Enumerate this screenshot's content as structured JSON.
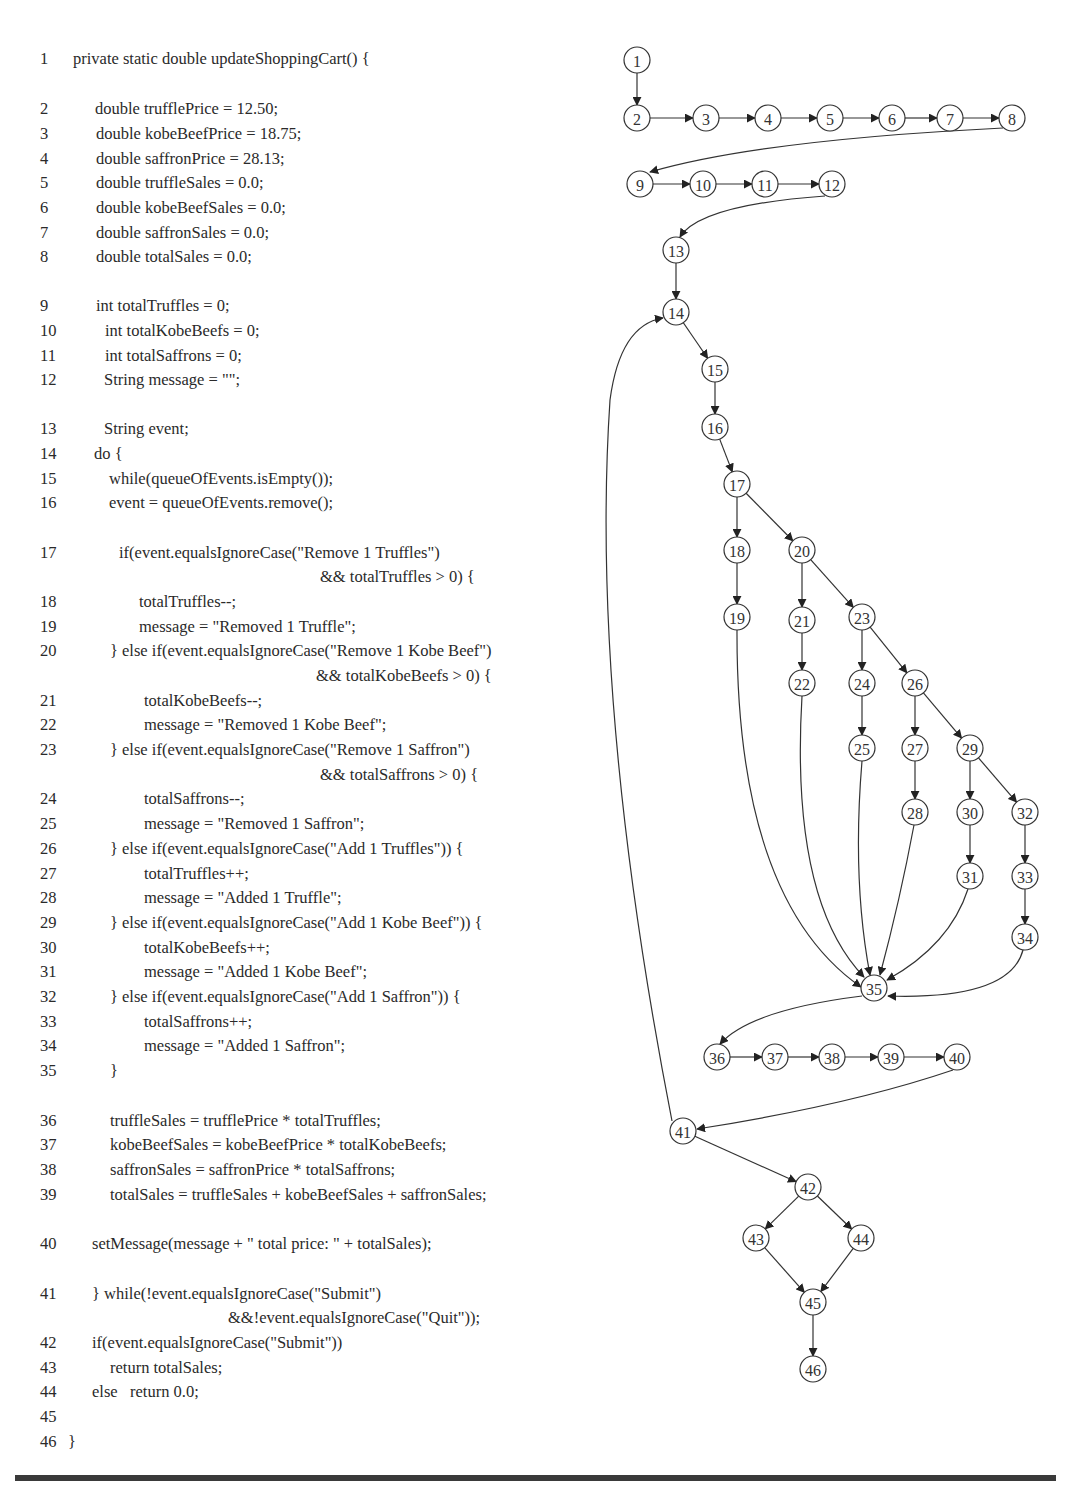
{
  "code": {
    "lines": [
      {
        "n": "1",
        "y": 60,
        "x": 73,
        "text": "private static double updateShoppingCart() {"
      },
      {
        "n": "2",
        "y": 110,
        "x": 95,
        "text": "double trufflePrice = 12.50;"
      },
      {
        "n": "3",
        "y": 135,
        "x": 96,
        "text": "double kobeBeefPrice = 18.75;"
      },
      {
        "n": "4",
        "y": 160,
        "x": 96,
        "text": "double saffronPrice = 28.13;"
      },
      {
        "n": "5",
        "y": 184,
        "x": 96,
        "text": "double truffleSales = 0.0;"
      },
      {
        "n": "6",
        "y": 209,
        "x": 96,
        "text": "double kobeBeefSales = 0.0;"
      },
      {
        "n": "7",
        "y": 234,
        "x": 96,
        "text": "double saffronSales = 0.0;"
      },
      {
        "n": "8",
        "y": 258,
        "x": 96,
        "text": "double totalSales = 0.0;"
      },
      {
        "n": "9",
        "y": 307,
        "x": 96,
        "text": "int totalTruffles = 0;"
      },
      {
        "n": "10",
        "y": 332,
        "x": 105,
        "text": "int totalKobeBeefs = 0;"
      },
      {
        "n": "11",
        "y": 357,
        "x": 105,
        "text": "int totalSaffrons = 0;"
      },
      {
        "n": "12",
        "y": 381,
        "x": 104,
        "text": "String message = \"\";"
      },
      {
        "n": "13",
        "y": 430,
        "x": 104,
        "text": "String event;"
      },
      {
        "n": "14",
        "y": 455,
        "x": 94,
        "text": "do {"
      },
      {
        "n": "15",
        "y": 480,
        "x": 109,
        "text": "while(queueOfEvents.isEmpty());"
      },
      {
        "n": "16",
        "y": 504,
        "x": 109,
        "text": "event = queueOfEvents.remove();"
      },
      {
        "n": "17",
        "y": 554,
        "x": 119,
        "text": "if(event.equalsIgnoreCase(\"Remove 1 Truffles\")"
      },
      {
        "n": "",
        "y": 578,
        "x": 320,
        "text": "&& totalTruffles > 0) {"
      },
      {
        "n": "18",
        "y": 603,
        "x": 139,
        "text": "totalTruffles--;"
      },
      {
        "n": "19",
        "y": 628,
        "x": 139,
        "text": "message = \"Removed 1 Truffle\";"
      },
      {
        "n": "20",
        "y": 652,
        "x": 110,
        "text": "} else if(event.equalsIgnoreCase(\"Remove 1 Kobe Beef\")"
      },
      {
        "n": "",
        "y": 677,
        "x": 316,
        "text": "&& totalKobeBeefs > 0) {"
      },
      {
        "n": "21",
        "y": 702,
        "x": 144,
        "text": "totalKobeBeefs--;"
      },
      {
        "n": "22",
        "y": 726,
        "x": 144,
        "text": "message = \"Removed 1 Kobe Beef\";"
      },
      {
        "n": "23",
        "y": 751,
        "x": 110,
        "text": "} else if(event.equalsIgnoreCase(\"Remove 1 Saffron\")"
      },
      {
        "n": "",
        "y": 776,
        "x": 320,
        "text": "&& totalSaffrons > 0) {"
      },
      {
        "n": "24",
        "y": 800,
        "x": 144,
        "text": "totalSaffrons--;"
      },
      {
        "n": "25",
        "y": 825,
        "x": 144,
        "text": "message = \"Removed 1 Saffron\";"
      },
      {
        "n": "26",
        "y": 850,
        "x": 110,
        "text": "} else if(event.equalsIgnoreCase(\"Add 1 Truffles\")) {"
      },
      {
        "n": "27",
        "y": 875,
        "x": 144,
        "text": "totalTruffles++;"
      },
      {
        "n": "28",
        "y": 899,
        "x": 144,
        "text": "message = \"Added 1 Truffle\";"
      },
      {
        "n": "29",
        "y": 924,
        "x": 110,
        "text": "} else if(event.equalsIgnoreCase(\"Add 1 Kobe Beef\")) {"
      },
      {
        "n": "30",
        "y": 949,
        "x": 144,
        "text": "totalKobeBeefs++;"
      },
      {
        "n": "31",
        "y": 973,
        "x": 144,
        "text": "message = \"Added 1 Kobe Beef\";"
      },
      {
        "n": "32",
        "y": 998,
        "x": 110,
        "text": "} else if(event.equalsIgnoreCase(\"Add 1 Saffron\")) {"
      },
      {
        "n": "33",
        "y": 1023,
        "x": 144,
        "text": "totalSaffrons++;"
      },
      {
        "n": "34",
        "y": 1047,
        "x": 144,
        "text": "message = \"Added 1 Saffron\";"
      },
      {
        "n": "35",
        "y": 1072,
        "x": 110,
        "text": "}"
      },
      {
        "n": "36",
        "y": 1122,
        "x": 110,
        "text": "truffleSales = trufflePrice * totalTruffles;"
      },
      {
        "n": "37",
        "y": 1146,
        "x": 110,
        "text": "kobeBeefSales = kobeBeefPrice * totalKobeBeefs;"
      },
      {
        "n": "38",
        "y": 1171,
        "x": 110,
        "text": "saffronSales = saffronPrice * totalSaffrons;"
      },
      {
        "n": "39",
        "y": 1196,
        "x": 110,
        "text": "totalSales = truffleSales + kobeBeefSales + saffronSales;"
      },
      {
        "n": "40",
        "y": 1245,
        "x": 92,
        "text": "setMessage(message + \" total price: \" + totalSales);"
      },
      {
        "n": "41",
        "y": 1295,
        "x": 92,
        "text": "} while(!event.equalsIgnoreCase(\"Submit\")"
      },
      {
        "n": "",
        "y": 1319,
        "x": 228,
        "text": "&&!event.equalsIgnoreCase(\"Quit\"));"
      },
      {
        "n": "42",
        "y": 1344,
        "x": 92,
        "text": "if(event.equalsIgnoreCase(\"Submit\"))"
      },
      {
        "n": "43",
        "y": 1369,
        "x": 110,
        "text": "return totalSales;"
      },
      {
        "n": "44",
        "y": 1393,
        "x": 92,
        "text": "else   return 0.0;"
      },
      {
        "n": "45",
        "y": 1418,
        "x": 92,
        "text": ""
      },
      {
        "n": "46",
        "y": 1443,
        "x": 68,
        "text": "}"
      }
    ]
  },
  "graph": {
    "nodes": [
      {
        "id": "1",
        "x": 637,
        "y": 60
      },
      {
        "id": "2",
        "x": 637,
        "y": 118
      },
      {
        "id": "3",
        "x": 706,
        "y": 118
      },
      {
        "id": "4",
        "x": 768,
        "y": 118
      },
      {
        "id": "5",
        "x": 830,
        "y": 118
      },
      {
        "id": "6",
        "x": 892,
        "y": 118
      },
      {
        "id": "7",
        "x": 950,
        "y": 118
      },
      {
        "id": "8",
        "x": 1012,
        "y": 118
      },
      {
        "id": "9",
        "x": 640,
        "y": 184
      },
      {
        "id": "10",
        "x": 703,
        "y": 184
      },
      {
        "id": "11",
        "x": 765,
        "y": 184
      },
      {
        "id": "12",
        "x": 832,
        "y": 184
      },
      {
        "id": "13",
        "x": 676,
        "y": 250
      },
      {
        "id": "14",
        "x": 676,
        "y": 312
      },
      {
        "id": "15",
        "x": 715,
        "y": 369
      },
      {
        "id": "16",
        "x": 715,
        "y": 427
      },
      {
        "id": "17",
        "x": 737,
        "y": 484
      },
      {
        "id": "18",
        "x": 737,
        "y": 550
      },
      {
        "id": "20",
        "x": 802,
        "y": 550
      },
      {
        "id": "19",
        "x": 737,
        "y": 617
      },
      {
        "id": "21",
        "x": 802,
        "y": 620
      },
      {
        "id": "23",
        "x": 862,
        "y": 617
      },
      {
        "id": "22",
        "x": 802,
        "y": 683
      },
      {
        "id": "24",
        "x": 862,
        "y": 683
      },
      {
        "id": "26",
        "x": 915,
        "y": 683
      },
      {
        "id": "25",
        "x": 862,
        "y": 748
      },
      {
        "id": "27",
        "x": 915,
        "y": 748
      },
      {
        "id": "29",
        "x": 970,
        "y": 748
      },
      {
        "id": "28",
        "x": 915,
        "y": 812
      },
      {
        "id": "30",
        "x": 970,
        "y": 812
      },
      {
        "id": "32",
        "x": 1025,
        "y": 812
      },
      {
        "id": "31",
        "x": 970,
        "y": 876
      },
      {
        "id": "33",
        "x": 1025,
        "y": 876
      },
      {
        "id": "34",
        "x": 1025,
        "y": 937
      },
      {
        "id": "35",
        "x": 874,
        "y": 988
      },
      {
        "id": "36",
        "x": 717,
        "y": 1057
      },
      {
        "id": "37",
        "x": 775,
        "y": 1057
      },
      {
        "id": "38",
        "x": 832,
        "y": 1057
      },
      {
        "id": "39",
        "x": 891,
        "y": 1057
      },
      {
        "id": "40",
        "x": 957,
        "y": 1057
      },
      {
        "id": "41",
        "x": 683,
        "y": 1131
      },
      {
        "id": "42",
        "x": 808,
        "y": 1187
      },
      {
        "id": "43",
        "x": 756,
        "y": 1238
      },
      {
        "id": "44",
        "x": 861,
        "y": 1238
      },
      {
        "id": "45",
        "x": 813,
        "y": 1302
      },
      {
        "id": "46",
        "x": 813,
        "y": 1369
      }
    ],
    "edges": [
      [
        "1",
        "2"
      ],
      [
        "2",
        "3"
      ],
      [
        "3",
        "4"
      ],
      [
        "4",
        "5"
      ],
      [
        "5",
        "6"
      ],
      [
        "6",
        "7"
      ],
      [
        "7",
        "8"
      ],
      [
        "8",
        "9"
      ],
      [
        "9",
        "10"
      ],
      [
        "10",
        "11"
      ],
      [
        "11",
        "12"
      ],
      [
        "12",
        "13"
      ],
      [
        "13",
        "14"
      ],
      [
        "14",
        "15"
      ],
      [
        "15",
        "16"
      ],
      [
        "16",
        "17"
      ],
      [
        "17",
        "18"
      ],
      [
        "17",
        "20"
      ],
      [
        "18",
        "19"
      ],
      [
        "20",
        "21"
      ],
      [
        "20",
        "23"
      ],
      [
        "21",
        "22"
      ],
      [
        "23",
        "24"
      ],
      [
        "23",
        "26"
      ],
      [
        "24",
        "25"
      ],
      [
        "26",
        "27"
      ],
      [
        "26",
        "29"
      ],
      [
        "27",
        "28"
      ],
      [
        "29",
        "30"
      ],
      [
        "29",
        "32"
      ],
      [
        "30",
        "31"
      ],
      [
        "32",
        "33"
      ],
      [
        "33",
        "34"
      ],
      [
        "19",
        "35"
      ],
      [
        "22",
        "35"
      ],
      [
        "25",
        "35"
      ],
      [
        "28",
        "35"
      ],
      [
        "31",
        "35"
      ],
      [
        "34",
        "35"
      ],
      [
        "35",
        "36"
      ],
      [
        "36",
        "37"
      ],
      [
        "37",
        "38"
      ],
      [
        "38",
        "39"
      ],
      [
        "39",
        "40"
      ],
      [
        "40",
        "41"
      ],
      [
        "41",
        "14"
      ],
      [
        "41",
        "42"
      ],
      [
        "42",
        "43"
      ],
      [
        "42",
        "44"
      ],
      [
        "43",
        "45"
      ],
      [
        "44",
        "45"
      ],
      [
        "45",
        "46"
      ]
    ]
  }
}
